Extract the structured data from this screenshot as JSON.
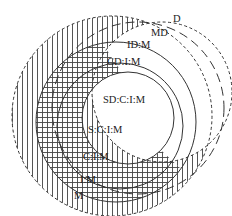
{
  "diagram": {
    "type": "nested-sets",
    "colors": {
      "line": "#333333",
      "hatch": "#555555",
      "background": "#ffffff"
    },
    "labels": {
      "D": "D",
      "MD": "MD",
      "IDM": "ID:M",
      "CDIM": "CD:I:M",
      "SDCIM": "SD:C:I:M",
      "SCIM": "S:C:I:M",
      "CIM": "C:I:M",
      "IM": "I:M",
      "M": "M"
    },
    "sets": [
      {
        "id": "M",
        "label": "M",
        "style": "dashed-short",
        "fill": "vertical-hatch"
      },
      {
        "id": "D",
        "label": "D",
        "style": "dashed-short",
        "fill": "none"
      },
      {
        "id": "MD",
        "label": "MD",
        "style": "dashed-long",
        "fill": "none"
      },
      {
        "id": "IDM",
        "label": "ID:M",
        "style": "solid",
        "fill": "none"
      },
      {
        "id": "CDIM",
        "label": "CD:I:M",
        "style": "solid",
        "fill": "none"
      },
      {
        "id": "SDCIM",
        "label": "SD:C:I:M",
        "style": "solid",
        "fill": "none"
      },
      {
        "id": "CIM",
        "label": "C:I:M",
        "style": "region",
        "fill": "cross-hatch"
      }
    ]
  }
}
